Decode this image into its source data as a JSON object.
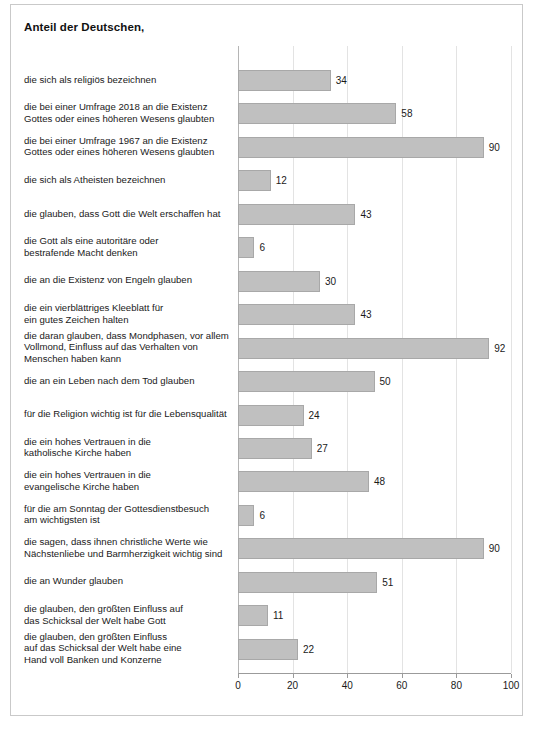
{
  "title": "Anteil der Deutschen,",
  "footnote": "",
  "axis": {
    "ticks": [
      "0",
      "20",
      "40",
      "60",
      "80",
      "100"
    ],
    "min": 0,
    "max": 100
  },
  "chart_data": {
    "type": "bar",
    "orientation": "horizontal",
    "title": "Anteil der Deutschen,",
    "xlabel": "",
    "ylabel": "",
    "xlim": [
      0,
      100
    ],
    "grid": true,
    "legend": false,
    "bar_color": "#c0c0c0",
    "bar_border_color": "#a8a8a8",
    "data_labels": true,
    "categories": [
      "die sich als religiös bezeichnen",
      "die bei einer Umfrage 2018 an die Existenz Gottes oder eines höheren Wesens glaubten",
      "die bei einer Umfrage 1967 an die Existenz Gottes oder eines höheren Wesens glaubten",
      "die sich als Atheisten bezeichnen",
      "die glauben, dass Gott die Welt erschaffen hat",
      "die Gott als eine autoritäre oder bestrafende Macht denken",
      "die an die Existenz von Engeln glauben",
      "die ein vierblättriges Kleeblatt für ein gutes Zeichen halten",
      "die daran glauben, dass Mondphasen, vor allem Vollmond, Einfluss auf das Verhalten von Menschen haben kann",
      "die an ein Leben nach dem Tod glauben",
      "für die Religion wichtig ist für die Lebensqualität",
      "die ein hohes Vertrauen in die katholische Kirche haben",
      "die ein hohes Vertrauen in die evangelische Kirche haben",
      "für die am Sonntag der Gottesdienstbesuch am wichtigsten ist",
      "die sagen, dass ihnen christliche Werte wie Nächstenliebe und Barmherzigkeit wichtig sind",
      "die an Wunder glauben",
      "die glauben, den größten Einfluss auf das Schicksal der Welt habe Gott",
      "die glauben, den größten Einfluss auf das Schicksal der Welt habe eine Hand voll Banken und Konzerne"
    ],
    "values": [
      34,
      58,
      90,
      12,
      43,
      6,
      30,
      43,
      92,
      50,
      24,
      27,
      48,
      6,
      90,
      51,
      11,
      22
    ]
  },
  "rows": [
    {
      "lines": [
        "die sich als religiös bezeichnen"
      ],
      "value": 34
    },
    {
      "lines": [
        "die bei einer Umfrage 2018 an die Existenz",
        "Gottes oder eines höheren Wesens glaubten"
      ],
      "value": 58
    },
    {
      "lines": [
        "die bei einer Umfrage 1967 an die Existenz",
        "Gottes oder eines höheren Wesens glaubten"
      ],
      "value": 90
    },
    {
      "lines": [
        "die sich als Atheisten bezeichnen"
      ],
      "value": 12
    },
    {
      "lines": [
        "die glauben, dass Gott die Welt erschaffen hat"
      ],
      "value": 43
    },
    {
      "lines": [
        "die Gott als eine autoritäre oder",
        "bestrafende Macht denken"
      ],
      "value": 6
    },
    {
      "lines": [
        "die an die Existenz von Engeln glauben"
      ],
      "value": 30
    },
    {
      "lines": [
        "die ein vierblättriges Kleeblatt für",
        "ein gutes Zeichen halten"
      ],
      "value": 43
    },
    {
      "lines": [
        "die daran glauben, dass Mondphasen, vor allem",
        "Vollmond, Einfluss auf das Verhalten von",
        "Menschen haben kann"
      ],
      "value": 92
    },
    {
      "lines": [
        "die an ein Leben nach dem Tod glauben"
      ],
      "value": 50
    },
    {
      "lines": [
        "für die Religion wichtig ist für die Lebensqualität"
      ],
      "value": 24
    },
    {
      "lines": [
        "die ein hohes Vertrauen in die",
        "katholische Kirche haben"
      ],
      "value": 27
    },
    {
      "lines": [
        "die ein hohes Vertrauen in die",
        "evangelische Kirche haben"
      ],
      "value": 48
    },
    {
      "lines": [
        "für die am Sonntag der Gottesdienstbesuch",
        "am wichtigsten ist"
      ],
      "value": 6
    },
    {
      "lines": [
        "die sagen, dass ihnen christliche Werte wie",
        "Nächstenliebe und Barmherzigkeit wichtig sind"
      ],
      "value": 90
    },
    {
      "lines": [
        "die an Wunder glauben"
      ],
      "value": 51
    },
    {
      "lines": [
        "die glauben, den größten Einfluss auf",
        "das Schicksal der Welt habe Gott"
      ],
      "value": 11
    },
    {
      "lines": [
        "die glauben, den größten Einfluss",
        "auf das Schicksal der Welt habe eine",
        "Hand voll Banken und Konzerne"
      ],
      "value": 22
    }
  ]
}
